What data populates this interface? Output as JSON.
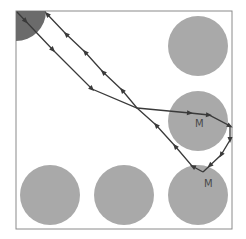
{
  "colors": {
    "background": "#ffffff",
    "frame": "#8a8a8a",
    "obstacle": "#a9a9a9",
    "start_region": "#6b6b6b",
    "path": "#3a3a3a",
    "label": "#4a4a4a"
  },
  "frame": {
    "x": 16,
    "y": 11,
    "width": 216,
    "height": 218
  },
  "start_region": {
    "cx": 16,
    "cy": 11,
    "r": 30
  },
  "obstacles": [
    {
      "id": "top-right",
      "cx": 198,
      "cy": 46,
      "r": 30,
      "label": ""
    },
    {
      "id": "mid-right",
      "cx": 198,
      "cy": 121,
      "r": 30,
      "label": "M"
    },
    {
      "id": "bottom-left",
      "cx": 50,
      "cy": 195,
      "r": 30,
      "label": ""
    },
    {
      "id": "bottom-middle",
      "cx": 124,
      "cy": 195,
      "r": 30,
      "label": ""
    },
    {
      "id": "bottom-right",
      "cx": 198,
      "cy": 195,
      "r": 30,
      "label": "M"
    }
  ],
  "labels": [
    {
      "text": "M",
      "x": 195,
      "y": 127
    },
    {
      "text": "M",
      "x": 204,
      "y": 187
    }
  ],
  "path_outbound": [
    [
      17,
      12
    ],
    [
      53,
      50
    ],
    [
      92,
      89
    ],
    [
      137,
      108
    ],
    [
      190,
      113
    ],
    [
      209,
      115
    ],
    [
      230,
      126
    ],
    [
      230,
      140
    ],
    [
      221,
      155
    ],
    [
      203,
      172
    ]
  ],
  "path_return": [
    [
      203,
      172
    ],
    [
      192,
      166
    ],
    [
      175,
      146
    ],
    [
      156,
      125
    ],
    [
      137,
      108
    ],
    [
      122,
      90
    ],
    [
      103,
      72
    ],
    [
      85,
      52
    ],
    [
      66,
      34
    ],
    [
      47,
      14
    ]
  ],
  "arrows_outbound": [
    [
      27,
      20
    ],
    [
      53,
      50
    ],
    [
      92,
      89
    ],
    [
      190,
      113
    ],
    [
      209,
      115
    ],
    [
      230,
      126
    ],
    [
      230,
      140
    ],
    [
      221,
      155
    ],
    [
      210,
      166
    ]
  ],
  "arrows_return": [
    [
      194,
      164
    ],
    [
      175,
      146
    ],
    [
      156,
      125
    ],
    [
      122,
      90
    ],
    [
      103,
      72
    ],
    [
      85,
      52
    ],
    [
      66,
      34
    ],
    [
      47,
      14
    ]
  ]
}
